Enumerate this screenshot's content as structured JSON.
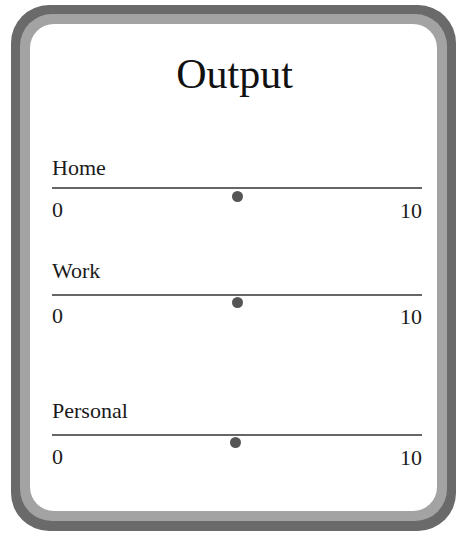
{
  "panel": {
    "title": "Output"
  },
  "sliders": [
    {
      "label": "Home",
      "min": "0",
      "max": "10",
      "value": 5
    },
    {
      "label": "Work",
      "min": "0",
      "max": "10",
      "value": 5
    },
    {
      "label": "Personal",
      "min": "0",
      "max": "10",
      "value": 5
    }
  ],
  "colors": {
    "frame_outer": "#6a6a6a",
    "frame_inner": "#a3a3a3",
    "track": "#666666",
    "knob": "#555555",
    "text": "#1a1a1a"
  }
}
